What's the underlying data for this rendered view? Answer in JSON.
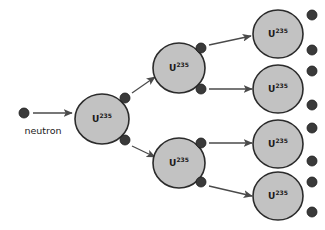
{
  "diagram": {
    "background_color": "#ffffff",
    "nucleus_fill_color": "#c2c2c2",
    "nucleus_stroke_color": "#2b2b2b",
    "neutron_color": "#3a3a3a",
    "arrow_color": "#4a4a4a",
    "text_color": "#1a1a1a",
    "caption": {
      "neutron_label": "neutron",
      "x": 43,
      "y": 134
    },
    "isotope": {
      "element_symbol": "U",
      "mass_number": "235",
      "full_label": "U235"
    },
    "generations": [
      {
        "index": 0,
        "name": "generation-1",
        "nuclei": [
          {
            "id": "u235-gen1-a",
            "cx": 102,
            "cy": 119,
            "rx": 27,
            "ry": 25
          }
        ]
      },
      {
        "index": 1,
        "name": "generation-2",
        "nuclei": [
          {
            "id": "u235-gen2-a",
            "cx": 179,
            "cy": 68,
            "rx": 26,
            "ry": 25
          },
          {
            "id": "u235-gen2-b",
            "cx": 179,
            "cy": 163,
            "rx": 26,
            "ry": 25
          }
        ]
      },
      {
        "index": 2,
        "name": "generation-3",
        "nuclei": [
          {
            "id": "u235-gen3-a",
            "cx": 278,
            "cy": 34,
            "rx": 25,
            "ry": 24
          },
          {
            "id": "u235-gen3-b",
            "cx": 278,
            "cy": 89,
            "rx": 25,
            "ry": 24
          },
          {
            "id": "u235-gen3-c",
            "cx": 278,
            "cy": 144,
            "rx": 25,
            "ry": 24
          },
          {
            "id": "u235-gen3-d",
            "cx": 278,
            "cy": 196,
            "rx": 25,
            "ry": 24
          }
        ]
      }
    ],
    "neutrons": [
      {
        "id": "neutron-incident",
        "cx": 24,
        "cy": 113,
        "r": 5
      },
      {
        "id": "neutron-gen1-up",
        "cx": 125,
        "cy": 98,
        "r": 5
      },
      {
        "id": "neutron-gen1-down",
        "cx": 125,
        "cy": 140,
        "r": 5
      },
      {
        "id": "neutron-gen2a-up",
        "cx": 201,
        "cy": 48,
        "r": 5
      },
      {
        "id": "neutron-gen2a-down",
        "cx": 201,
        "cy": 89,
        "r": 5
      },
      {
        "id": "neutron-gen2b-up",
        "cx": 201,
        "cy": 143,
        "r": 5
      },
      {
        "id": "neutron-gen2b-down",
        "cx": 201,
        "cy": 182,
        "r": 5
      },
      {
        "id": "neutron-gen3a-up",
        "cx": 312,
        "cy": 15,
        "r": 5
      },
      {
        "id": "neutron-gen3a-down",
        "cx": 312,
        "cy": 50,
        "r": 5
      },
      {
        "id": "neutron-gen3b-up",
        "cx": 312,
        "cy": 71,
        "r": 5
      },
      {
        "id": "neutron-gen3b-down",
        "cx": 312,
        "cy": 105,
        "r": 5
      },
      {
        "id": "neutron-gen3c-up",
        "cx": 312,
        "cy": 128,
        "r": 5
      },
      {
        "id": "neutron-gen3c-down",
        "cx": 312,
        "cy": 161,
        "r": 5
      },
      {
        "id": "neutron-gen3d-up",
        "cx": 312,
        "cy": 182,
        "r": 5
      },
      {
        "id": "neutron-gen3d-down",
        "cx": 312,
        "cy": 212,
        "r": 5
      }
    ],
    "arrows": [
      {
        "id": "arrow-incident",
        "x1": 33,
        "y1": 113,
        "x2": 72,
        "y2": 113
      },
      {
        "id": "arrow-gen1-to-gen2a",
        "x1": 132,
        "y1": 93,
        "x2": 155,
        "y2": 77
      },
      {
        "id": "arrow-gen1-to-gen2b",
        "x1": 132,
        "y1": 146,
        "x2": 155,
        "y2": 157
      },
      {
        "id": "arrow-gen2a-to-gen3a",
        "x1": 209,
        "y1": 45,
        "x2": 251,
        "y2": 36
      },
      {
        "id": "arrow-gen2a-to-gen3b",
        "x1": 209,
        "y1": 89,
        "x2": 252,
        "y2": 89
      },
      {
        "id": "arrow-gen2b-to-gen3c",
        "x1": 209,
        "y1": 143,
        "x2": 252,
        "y2": 143
      },
      {
        "id": "arrow-gen2b-to-gen3d",
        "x1": 209,
        "y1": 186,
        "x2": 252,
        "y2": 196
      }
    ]
  }
}
